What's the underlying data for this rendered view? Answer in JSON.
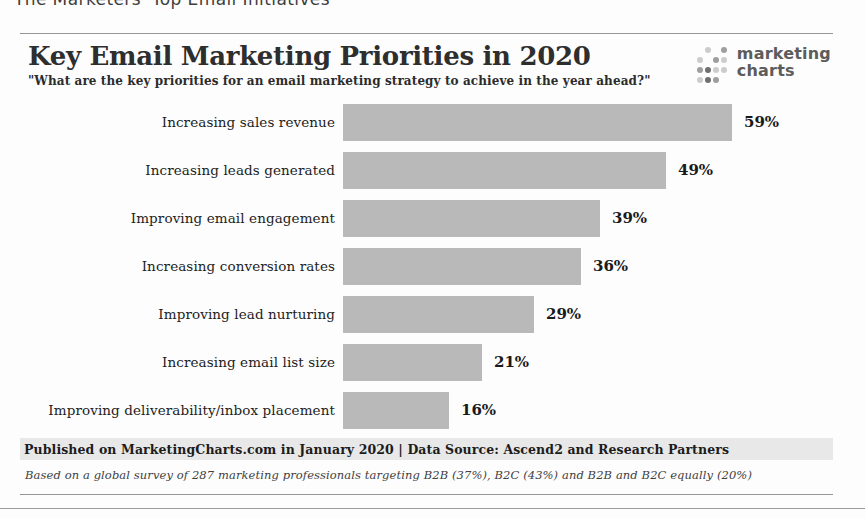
{
  "page": {
    "clipped_heading": "The Marketers' Top Email Initiatives"
  },
  "logo": {
    "line1": "marketing",
    "line2": "charts"
  },
  "chart_data": {
    "type": "bar",
    "orientation": "horizontal",
    "title": "Key Email Marketing Priorities in 2020",
    "subtitle": "\"What are the key priorities for an email marketing strategy to achieve in the year ahead?\"",
    "categories": [
      "Increasing sales revenue",
      "Increasing leads generated",
      "Improving email engagement",
      "Increasing conversion rates",
      "Improving lead nurturing",
      "Increasing email list size",
      "Improving deliverability/inbox placement"
    ],
    "values": [
      59,
      49,
      39,
      36,
      29,
      21,
      16
    ],
    "unit": "%",
    "value_label_format": "{value}%",
    "xlim": [
      0,
      65
    ],
    "grid": false,
    "legend": false,
    "bar_color": "#b9b9b9",
    "px_per_percent": 6.6
  },
  "footer": {
    "published": "Published on MarketingCharts.com in January 2020 | Data Source: Ascend2 and Research Partners",
    "note": "Based on a global survey of 287 marketing professionals targeting B2B (37%), B2C (43%) and B2B and B2C equally (20%)"
  },
  "colors": {
    "bar": "#b9b9b9",
    "footer_band_bg": "#e8e8e8",
    "rule_lines": "#979797",
    "title_text": "#2e2e2e",
    "logo_text": "#5c5c5c"
  }
}
